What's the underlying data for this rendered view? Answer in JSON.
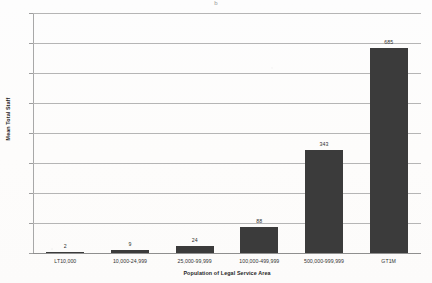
{
  "chart_data": {
    "type": "bar",
    "title": "",
    "subtitle": "",
    "xlabel": "Population of Legal Service Area",
    "ylabel": "Mean Total Staff",
    "categories": [
      "LT10,000",
      "10,000-24,999",
      "25,000-99,999",
      "100,000-499,999",
      "500,000-999,999",
      "GT1M"
    ],
    "values": [
      2,
      9,
      24,
      88,
      343,
      685
    ],
    "value_labels": [
      "2",
      "9",
      "24",
      "88",
      "343",
      "685"
    ],
    "ylim": [
      0,
      800
    ],
    "ytick_values": [
      0,
      100,
      200,
      300,
      400,
      500,
      600,
      700,
      800
    ],
    "ytick_labels": [
      "0",
      "100",
      "200",
      "300",
      "400",
      "500",
      "600",
      "700",
      "800"
    ],
    "grid": true,
    "grid_axis": "y",
    "legend": false,
    "legend_position": "none",
    "bar_color": "#3b3b3b",
    "grid_color": "#b5b5b5",
    "text_color": "#333333",
    "background_color": "#fdfdfd"
  },
  "artifacts": {
    "top_mark": "b"
  }
}
